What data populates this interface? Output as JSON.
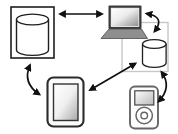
{
  "diagram": {
    "type": "device-sync-diagram",
    "background": "#ffffff",
    "colors": {
      "outline": "#1f1f1f",
      "arrow": "#111111",
      "connector_box": "#c7c7c7",
      "laptop_base": "#8f8f8f",
      "screen_bezel": "#3a3a3a",
      "device_outline": "#666666",
      "fill_white": "#ffffff"
    },
    "nodes": [
      {
        "id": "database",
        "icon": "database-cylinder-icon",
        "shape": "cylinder-inside-rectangle",
        "position": "top-left"
      },
      {
        "id": "laptop",
        "icon": "laptop-icon",
        "shape": "laptop-computer",
        "position": "top-right"
      },
      {
        "id": "local-database",
        "icon": "small-cylinder-icon",
        "shape": "small-cylinder",
        "position": "middle-right",
        "grouped_with": "laptop"
      },
      {
        "id": "tablet",
        "icon": "tablet-icon",
        "shape": "tablet-device",
        "position": "bottom-center-left"
      },
      {
        "id": "media-player",
        "icon": "media-player-icon",
        "shape": "click-wheel-media-player",
        "position": "bottom-right"
      }
    ],
    "edges": [
      {
        "from": "database",
        "to": "laptop",
        "line": "straight",
        "arrows": "both"
      },
      {
        "from": "laptop",
        "to": "local-database",
        "line": "curved",
        "arrows": "both"
      },
      {
        "from": "database",
        "to": "tablet",
        "line": "curved",
        "arrows": "both"
      },
      {
        "from": "tablet",
        "to": "local-database",
        "line": "straight-diagonal",
        "arrows": "both"
      },
      {
        "from": "local-database",
        "to": "media-player",
        "line": "curved",
        "arrows": "both"
      }
    ]
  }
}
